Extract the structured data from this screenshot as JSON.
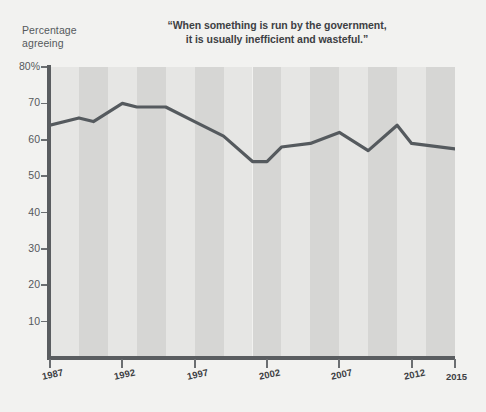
{
  "axis_label": "Percentage\nagreeing",
  "chart_data": {
    "type": "line",
    "title": "“When something is run by the government,\nit is usually inefficient and wasteful.”",
    "title_line1": "“When something is run by the government,",
    "title_line2": "it is usually inefficient and wasteful.”",
    "xlabel": "",
    "ylabel": "Percentage agreeing",
    "ylim": [
      0,
      80
    ],
    "xlim": [
      1987,
      2015
    ],
    "grid": false,
    "legend": null,
    "y_ticks": [
      80,
      70,
      60,
      50,
      40,
      30,
      20,
      10
    ],
    "y_tick_labels": [
      "80%",
      "70",
      "60",
      "50",
      "40",
      "30",
      "20",
      "10"
    ],
    "x_ticks": [
      1987,
      1992,
      1997,
      2002,
      2007,
      2012,
      2015
    ],
    "x_tick_labels": [
      "1987",
      "1992",
      "1997",
      "2002",
      "2007",
      "2012",
      "2015"
    ],
    "series": [
      {
        "name": "Percentage agreeing",
        "color": "#555a5e",
        "x": [
          1987,
          1989,
          1990,
          1992,
          1993,
          1995,
          1997,
          1999,
          2001,
          2002,
          2003,
          2005,
          2007,
          2009,
          2011,
          2012,
          2015
        ],
        "values": [
          64,
          66,
          65,
          70,
          69,
          69,
          65,
          61,
          54,
          54,
          58,
          59,
          62,
          57,
          64,
          59,
          57.5
        ]
      }
    ],
    "band_color_light": "#e6e6e4",
    "band_color_dark": "#d6d6d4",
    "background": "#f2f2f0",
    "axis_color": "#5a5d60"
  }
}
